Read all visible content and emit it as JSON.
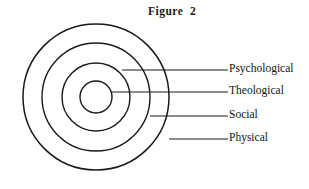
{
  "figure": {
    "title": "Figure  2",
    "type": "concentric-circles-diagram",
    "background_color": "#ffffff",
    "stroke_color": "#1a1a1a"
  },
  "chart_data": {
    "type": "diagram",
    "title": "Figure  2",
    "center": {
      "x": 96,
      "y": 97
    },
    "rings": [
      {
        "label": "Theological",
        "radius": 16,
        "order": 1
      },
      {
        "label": "Social",
        "radius": 34,
        "order": 2
      },
      {
        "label": "Psychological",
        "radius": 54,
        "order": 3
      },
      {
        "label": "Physical",
        "radius": 73,
        "order": 4
      }
    ],
    "leader_lines": [
      {
        "label": "Psychological",
        "x1": 122,
        "y1": 70,
        "x2": 228,
        "y2": 70
      },
      {
        "label": "Theological",
        "x1": 112,
        "y1": 92,
        "x2": 228,
        "y2": 92
      },
      {
        "label": "Social",
        "x1": 150,
        "y1": 116,
        "x2": 228,
        "y2": 116
      },
      {
        "label": "Physical",
        "x1": 169,
        "y1": 139,
        "x2": 228,
        "y2": 139
      }
    ],
    "labels": [
      "Psychological",
      "Theological",
      "Social",
      "Physical"
    ]
  },
  "labels": {
    "psychological": "Psychological",
    "theological": "Theological",
    "social": "Social",
    "physical": "Physical"
  }
}
